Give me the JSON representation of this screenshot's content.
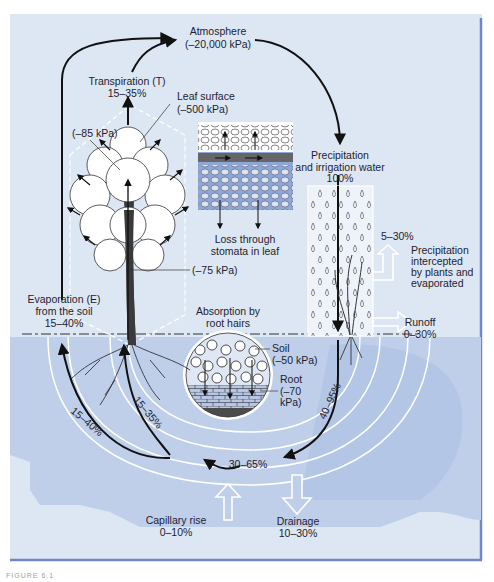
{
  "colors": {
    "panel_bg": "#dde7f3",
    "soil_bg": "#bfcfea",
    "frame": "#6f86c8",
    "arrow": "#111111",
    "white_band": "#ffffff",
    "leaf_blue": "#8ea6d8"
  },
  "diagram": {
    "atmosphere": {
      "title": "Atmosphere",
      "potential": "(–20,000 kPa)"
    },
    "transpiration": {
      "title": "Transpiration (T)",
      "percent": "15–35%"
    },
    "leaf_surface": {
      "title": "Leaf surface",
      "potential": "(–500 kPa)"
    },
    "leaf_inner": {
      "potential": "(–85 kPa)"
    },
    "stem": {
      "potential": "(–75 kPa)"
    },
    "leaf_inset": {
      "caption_line1": "Loss through",
      "caption_line2": "stomata in leaf"
    },
    "precipitation": {
      "line1": "Precipitation",
      "line2": "and irrigation water",
      "percent": "100%"
    },
    "interception": {
      "percent": "5–30%",
      "line1": "Precipitation",
      "line2": "intercepted",
      "line3": "by plants and",
      "line4": "evaporated"
    },
    "runoff": {
      "title": "Runoff",
      "percent": "0–30%"
    },
    "evaporation": {
      "line1": "Evaporation (E)",
      "line2": "from the soil",
      "percent": "15–40%"
    },
    "absorption": {
      "line1": "Absorption by",
      "line2": "root hairs"
    },
    "soil": {
      "title": "Soil",
      "potential": "(–50 kPa)"
    },
    "root": {
      "title": "Root",
      "potential_line1": "(–70",
      "potential_line2": "kPa)"
    },
    "flows": {
      "infiltration": "40–95%",
      "soil_water": "30–65%",
      "to_evaporation": "15–40%",
      "to_transpiration": "15–35%"
    },
    "capillary_rise": {
      "title": "Capillary rise",
      "percent": "0–10%"
    },
    "drainage": {
      "title": "Drainage",
      "percent": "10–30%"
    }
  },
  "caption": "FIGURE 6.1"
}
